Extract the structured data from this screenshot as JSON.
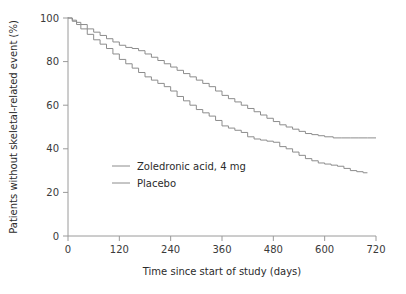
{
  "chart_data": {
    "type": "line",
    "title": "",
    "xlabel": "Time since start of study (days)",
    "ylabel": "Patients without skeletal-related event (%)",
    "xlim": [
      0,
      720
    ],
    "ylim": [
      0,
      100
    ],
    "xticks": [
      0,
      120,
      240,
      360,
      480,
      600,
      720
    ],
    "xtick_labels": [
      "0",
      "120",
      "240",
      "360",
      "480",
      "600",
      "720"
    ],
    "yticks": [
      0,
      20,
      40,
      60,
      80,
      100
    ],
    "ytick_labels": [
      "0",
      "20",
      "40",
      "60",
      "80",
      "100"
    ],
    "grid": false,
    "legend_position": "center-left",
    "style": "kaplan-meier step",
    "series": [
      {
        "name": "Zoledronic acid, 4 mg",
        "color": "#8c8c8c",
        "x": [
          0,
          10,
          20,
          30,
          45,
          60,
          75,
          90,
          105,
          120,
          135,
          150,
          165,
          180,
          195,
          210,
          225,
          240,
          255,
          270,
          285,
          300,
          315,
          330,
          345,
          360,
          375,
          390,
          405,
          420,
          435,
          450,
          465,
          480,
          495,
          510,
          525,
          540,
          555,
          570,
          585,
          600,
          620,
          640,
          660,
          680,
          700,
          720
        ],
        "y": [
          100,
          99,
          98,
          97,
          95,
          93.5,
          92,
          90.5,
          89,
          87.5,
          86.5,
          86,
          85,
          83.5,
          82,
          80.5,
          79,
          77.5,
          76,
          74.5,
          73,
          71.5,
          70,
          68.5,
          66.5,
          64.5,
          63,
          61.5,
          60,
          58.5,
          57,
          55.5,
          54,
          52.5,
          51,
          50,
          49,
          48,
          47,
          46.5,
          46,
          45.5,
          45,
          45,
          45,
          45,
          45,
          45
        ]
      },
      {
        "name": "Placebo",
        "color": "#8c8c8c",
        "x": [
          0,
          10,
          20,
          30,
          45,
          60,
          75,
          90,
          105,
          120,
          135,
          150,
          165,
          180,
          195,
          210,
          225,
          240,
          255,
          270,
          285,
          300,
          315,
          330,
          345,
          360,
          375,
          390,
          405,
          420,
          435,
          450,
          465,
          480,
          495,
          510,
          525,
          540,
          555,
          570,
          585,
          600,
          615,
          630,
          645,
          660,
          675,
          690,
          700
        ],
        "y": [
          100,
          98.5,
          97,
          95,
          92.5,
          90,
          88,
          86,
          83.5,
          81,
          79,
          77,
          75,
          73,
          71.5,
          70,
          68.5,
          66.5,
          64,
          62,
          60,
          58,
          56.5,
          55,
          53,
          50.5,
          49.5,
          48.5,
          47.5,
          45.5,
          44.5,
          44,
          43.5,
          43,
          41,
          40,
          38.5,
          37,
          35.5,
          34.5,
          33.5,
          33,
          32.5,
          32,
          31,
          30,
          29.5,
          29,
          29
        ]
      }
    ],
    "annotations": []
  },
  "legend": {
    "items": [
      {
        "label": "Zoledronic acid, 4 mg",
        "swatch_color": "#8c8c8c"
      },
      {
        "label": "Placebo",
        "swatch_color": "#8c8c8c"
      }
    ]
  },
  "axis": {
    "x_title": "Time since start of study (days)",
    "y_title": "Patients without skeletal-related event (%)"
  }
}
